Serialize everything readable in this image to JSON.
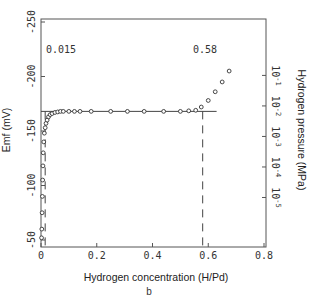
{
  "chart_data": {
    "type": "scatter",
    "title": "",
    "subtitle": "b",
    "xlabel": "Hydrogen concentration (H/Pd)",
    "ylabel": "Emf (mV)",
    "y2label": "Hydrogen pressure (MPa)",
    "xlim": [
      0,
      0.8
    ],
    "ylim": [
      -50,
      -250
    ],
    "x_ticks": [
      "0",
      "0.2",
      "0.4",
      "0.6",
      "0.8"
    ],
    "x_tick_values": [
      0,
      0.2,
      0.4,
      0.6,
      0.8
    ],
    "y_ticks": [
      "-50",
      "-100",
      "-150",
      "-200",
      "-250"
    ],
    "y_tick_values": [
      -50,
      -100,
      -150,
      -200,
      -250
    ],
    "y2_ticks": [
      "10^-1",
      "10^-2",
      "10^-3",
      "10^-4",
      "10^-5"
    ],
    "y2_tick_y_emf": [
      -201,
      -173,
      -145,
      -117,
      -89
    ],
    "grid": false,
    "legend": null,
    "annotations": [
      {
        "text": "0.015",
        "x": 0.015,
        "y": -225
      },
      {
        "text": "0.58",
        "x": 0.58,
        "y": -225
      }
    ],
    "plateau": {
      "emf": -168,
      "x_start": 0.0,
      "x_end": 0.58
    },
    "dashed_lines": [
      {
        "x": 0.015,
        "from_emf": -168,
        "to_emf": -50
      },
      {
        "x": 0.58,
        "from_emf": -168,
        "to_emf": -50
      }
    ],
    "series": [
      {
        "name": "Emf data",
        "marker": "open-circle",
        "x": [
          0.002,
          0.003,
          0.004,
          0.005,
          0.006,
          0.007,
          0.008,
          0.01,
          0.012,
          0.015,
          0.018,
          0.022,
          0.027,
          0.033,
          0.04,
          0.05,
          0.06,
          0.07,
          0.08,
          0.1,
          0.12,
          0.14,
          0.18,
          0.25,
          0.31,
          0.37,
          0.44,
          0.5,
          0.53,
          0.555,
          0.575,
          0.6,
          0.625,
          0.65,
          0.675
        ],
        "y": [
          -52,
          -60,
          -75,
          -90,
          -105,
          -118,
          -130,
          -140,
          -148,
          -153,
          -157,
          -160,
          -163,
          -165,
          -166,
          -167,
          -167.5,
          -168,
          -168,
          -168,
          -168,
          -168,
          -168,
          -168,
          -168,
          -168,
          -168,
          -168,
          -168.5,
          -169,
          -172,
          -178,
          -186,
          -195,
          -205
        ]
      }
    ]
  }
}
